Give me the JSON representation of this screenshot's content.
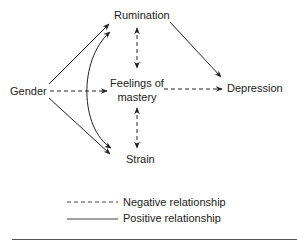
{
  "diagram": {
    "nodes": {
      "gender": "Gender",
      "rumination": "Rumination",
      "mastery_line1": "Feelings of",
      "mastery_line2": "mastery",
      "depression": "Depression",
      "strain": "Strain"
    },
    "edges": [
      {
        "from": "Gender",
        "to": "Rumination",
        "style": "solid",
        "meaning": "positive"
      },
      {
        "from": "Gender",
        "to": "Strain",
        "style": "solid",
        "meaning": "positive"
      },
      {
        "from": "Gender",
        "to": "Feelings of mastery",
        "style": "dashed",
        "meaning": "negative"
      },
      {
        "from": "Rumination",
        "to": "Depression",
        "style": "solid",
        "meaning": "positive"
      },
      {
        "from": "Feelings of mastery",
        "to": "Depression",
        "style": "dashed",
        "meaning": "negative"
      },
      {
        "from": "Rumination",
        "to": "Feelings of mastery",
        "style": "dashed",
        "meaning": "negative",
        "bidirectional": true
      },
      {
        "from": "Feelings of mastery",
        "to": "Strain",
        "style": "dashed",
        "meaning": "negative",
        "bidirectional": true
      },
      {
        "from": "Rumination",
        "to": "Strain",
        "style": "solid-curved",
        "meaning": "positive",
        "bidirectional": true
      }
    ],
    "legend": {
      "negative": "Negative relationship",
      "positive": "Positive relationship"
    },
    "colors": {
      "line": "#222222",
      "text": "#222222",
      "rule": "#555555"
    }
  }
}
